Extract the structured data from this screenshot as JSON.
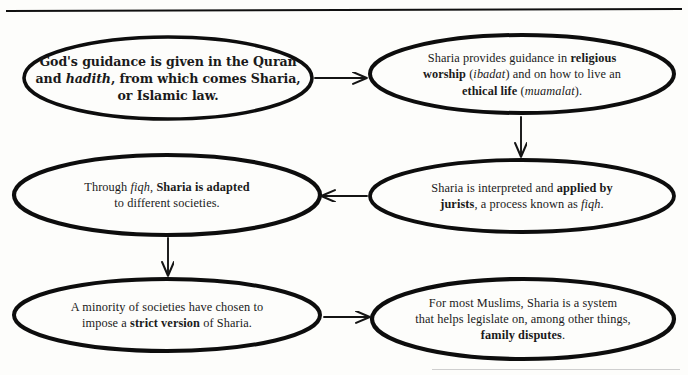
{
  "diagram": {
    "background_color": "#fdfdfb",
    "ink_color": "#101010",
    "rules": {
      "top_rule": "horizontal-rule",
      "bottom_rule": "faint-horizontal-rule"
    },
    "nodes": [
      {
        "id": "node-1",
        "name": "gods-guidance-node",
        "plain_text": "God's guidance is given in the Quran and hadith, from which comes Sharia, or Islamic law.",
        "lines": [
          [
            {
              "t": "God's guidance is given in the Quran",
              "style": "bold"
            }
          ],
          [
            {
              "t": "and ",
              "style": "bold"
            },
            {
              "t": "hadith",
              "style": "bold-italic"
            },
            {
              "t": ", from which comes Sharia,",
              "style": "bold"
            }
          ],
          [
            {
              "t": "or Islamic law.",
              "style": "bold"
            }
          ]
        ]
      },
      {
        "id": "node-2",
        "name": "religious-worship-node",
        "plain_text": "Sharia provides guidance in religious worship (ibadat) and on how to live an ethical life (muamalat).",
        "lines": [
          [
            {
              "t": "Sharia provides guidance in ",
              "style": "normal"
            },
            {
              "t": "religious",
              "style": "bold"
            }
          ],
          [
            {
              "t": "worship",
              "style": "bold"
            },
            {
              "t": " (",
              "style": "normal"
            },
            {
              "t": "ibadat",
              "style": "italic"
            },
            {
              "t": ") and on how to live an",
              "style": "normal"
            }
          ],
          [
            {
              "t": "ethical life",
              "style": "bold"
            },
            {
              "t": " (",
              "style": "normal"
            },
            {
              "t": "muamalat",
              "style": "italic"
            },
            {
              "t": ").",
              "style": "normal"
            }
          ]
        ]
      },
      {
        "id": "node-3",
        "name": "applied-by-jurists-node",
        "plain_text": "Sharia is interpreted and applied by jurists, a process known as fiqh.",
        "lines": [
          [
            {
              "t": "Sharia is interpreted and ",
              "style": "normal"
            },
            {
              "t": "applied by",
              "style": "bold"
            }
          ],
          [
            {
              "t": "jurists",
              "style": "bold"
            },
            {
              "t": ", a process known as ",
              "style": "normal"
            },
            {
              "t": "fiqh",
              "style": "italic"
            },
            {
              "t": ".",
              "style": "normal"
            }
          ]
        ]
      },
      {
        "id": "node-4",
        "name": "sharia-adapted-node",
        "plain_text": "Through fiqh, Sharia is adapted to different societies.",
        "lines": [
          [
            {
              "t": "Through ",
              "style": "normal"
            },
            {
              "t": "fiqh",
              "style": "italic"
            },
            {
              "t": ", ",
              "style": "normal"
            },
            {
              "t": "Sharia is adapted",
              "style": "bold"
            }
          ],
          [
            {
              "t": "to different societies.",
              "style": "normal"
            }
          ]
        ]
      },
      {
        "id": "node-5",
        "name": "strict-version-node",
        "plain_text": "A minority of societies have chosen to impose a strict version of Sharia.",
        "lines": [
          [
            {
              "t": "A minority of societies have chosen to",
              "style": "normal"
            }
          ],
          [
            {
              "t": "impose a ",
              "style": "normal"
            },
            {
              "t": "strict version",
              "style": "bold"
            },
            {
              "t": " of Sharia.",
              "style": "normal"
            }
          ]
        ]
      },
      {
        "id": "node-6",
        "name": "family-disputes-node",
        "plain_text": "For most Muslims, Sharia is a system that helps legislate on, among other things, family disputes.",
        "lines": [
          [
            {
              "t": "For most Muslims, Sharia is a system",
              "style": "normal"
            }
          ],
          [
            {
              "t": "that helps legislate on, among other things,",
              "style": "normal"
            }
          ],
          [
            {
              "t": "family disputes",
              "style": "bold"
            },
            {
              "t": ".",
              "style": "normal"
            }
          ]
        ]
      }
    ],
    "arrows": [
      {
        "name": "arrow-node1-to-node2",
        "from": "node-1",
        "to": "node-2",
        "direction": "right"
      },
      {
        "name": "arrow-node2-to-node3",
        "from": "node-2",
        "to": "node-3",
        "direction": "down"
      },
      {
        "name": "arrow-node3-to-node4",
        "from": "node-3",
        "to": "node-4",
        "direction": "left"
      },
      {
        "name": "arrow-node4-to-node5",
        "from": "node-4",
        "to": "node-5",
        "direction": "down"
      },
      {
        "name": "arrow-node5-to-node6",
        "from": "node-5",
        "to": "node-6",
        "direction": "right"
      }
    ]
  }
}
